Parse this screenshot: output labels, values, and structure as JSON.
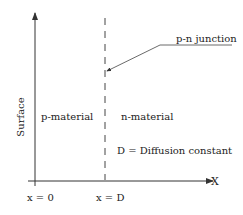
{
  "diagram": {
    "y_axis_label": "Surface",
    "x_axis_label": "X",
    "regions": {
      "left": "p-material",
      "right": "n-material"
    },
    "junction_label": "p-n junction",
    "note": "D = Diffusion constant",
    "x_ticks": [
      "x = 0",
      "x = D"
    ]
  }
}
